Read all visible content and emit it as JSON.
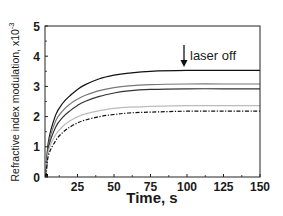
{
  "chart_data": {
    "type": "line",
    "title": "",
    "xlabel": "Time, s",
    "ylabel": "Refractive index modulation, x10",
    "ylabel_exponent": "-3",
    "xlim": [
      2,
      150
    ],
    "ylim": [
      0,
      5
    ],
    "x_ticks": [
      25,
      50,
      75,
      100,
      125,
      150
    ],
    "y_ticks": [
      0,
      1,
      2,
      3,
      4,
      5
    ],
    "grid": false,
    "legend": null,
    "annotations": [
      {
        "text": "laser off",
        "arrow": "down",
        "x": 100,
        "y": 3.55
      }
    ],
    "x": [
      2,
      5,
      10,
      15,
      20,
      25,
      30,
      40,
      50,
      60,
      75,
      100,
      125,
      150
    ],
    "series": [
      {
        "name": "curve-1",
        "style": "solid",
        "color": "#111111",
        "values": [
          0.0,
          1.15,
          2.05,
          2.45,
          2.7,
          2.9,
          3.05,
          3.25,
          3.37,
          3.44,
          3.5,
          3.53,
          3.53,
          3.53
        ]
      },
      {
        "name": "curve-2",
        "style": "solid",
        "color": "#777777",
        "values": [
          0.0,
          1.05,
          1.85,
          2.2,
          2.42,
          2.58,
          2.7,
          2.86,
          2.96,
          3.02,
          3.06,
          3.08,
          3.08,
          3.08
        ]
      },
      {
        "name": "curve-3",
        "style": "solid",
        "color": "#333333",
        "values": [
          0.0,
          0.95,
          1.65,
          1.98,
          2.2,
          2.37,
          2.5,
          2.67,
          2.78,
          2.85,
          2.9,
          2.92,
          2.92,
          2.92
        ]
      },
      {
        "name": "curve-4",
        "style": "solid",
        "color": "#bbbbbb",
        "values": [
          0.0,
          0.85,
          1.4,
          1.68,
          1.86,
          1.99,
          2.08,
          2.2,
          2.27,
          2.31,
          2.34,
          2.36,
          2.36,
          2.36
        ]
      },
      {
        "name": "curve-5",
        "style": "dashdot",
        "color": "#111111",
        "values": [
          0.0,
          0.7,
          1.2,
          1.48,
          1.66,
          1.79,
          1.88,
          2.0,
          2.07,
          2.12,
          2.15,
          2.18,
          2.18,
          2.18
        ]
      }
    ]
  }
}
